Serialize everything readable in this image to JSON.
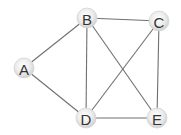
{
  "diagram": {
    "type": "undirected-graph",
    "width": 181,
    "height": 135,
    "node_radius": 10,
    "colors": {
      "edge": "#707070",
      "node_fill_center": "#ffffff",
      "node_fill_edge": "#cfcfcf",
      "node_stroke": "#d4d4d4",
      "label": "#333333",
      "background": "#ffffff"
    },
    "nodes": [
      {
        "id": "A",
        "label": "A",
        "x": 24,
        "y": 68
      },
      {
        "id": "B",
        "label": "B",
        "x": 87,
        "y": 18
      },
      {
        "id": "C",
        "label": "C",
        "x": 159,
        "y": 21
      },
      {
        "id": "D",
        "label": "D",
        "x": 86,
        "y": 118
      },
      {
        "id": "E",
        "label": "E",
        "x": 157,
        "y": 118
      }
    ],
    "edges": [
      {
        "from": "A",
        "to": "B"
      },
      {
        "from": "A",
        "to": "D"
      },
      {
        "from": "B",
        "to": "C"
      },
      {
        "from": "B",
        "to": "D"
      },
      {
        "from": "B",
        "to": "E"
      },
      {
        "from": "C",
        "to": "D"
      },
      {
        "from": "C",
        "to": "E"
      },
      {
        "from": "D",
        "to": "E"
      }
    ]
  }
}
